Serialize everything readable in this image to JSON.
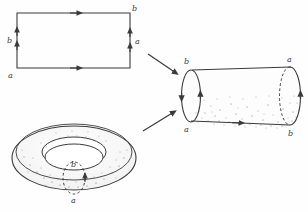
{
  "figure": {
    "type": "mathematical-diagram",
    "background_color": "#fefefe",
    "ink_color": "#3a3a3a",
    "stipple_color": "#6b6b6b"
  },
  "panels": {
    "rectangle": {
      "name": "identification-rectangle",
      "edges": {
        "top": {
          "label": "",
          "arrows": 1,
          "direction": "right"
        },
        "bottom": {
          "label": "",
          "arrows": 1,
          "direction": "right"
        },
        "left": {
          "label": "b",
          "arrows": 2,
          "direction": "up"
        },
        "right": {
          "label": "a",
          "arrows": 2,
          "direction": "up"
        }
      },
      "corners": {
        "bottom_left": "a",
        "top_right": "b"
      }
    },
    "cylinder": {
      "name": "intermediate-cylinder",
      "labels": {
        "left_top": "b",
        "left_bottom": "a",
        "right_top": "a",
        "right_bottom": "b"
      },
      "edges": {
        "top": {
          "arrows": 0
        },
        "bottom": {
          "arrows": 1,
          "direction": "right"
        },
        "left_circle": {
          "arrows": 2
        },
        "right_circle": {
          "arrows": 1,
          "style": "dashed-back-edge"
        }
      }
    },
    "torus": {
      "name": "resulting-torus",
      "labels": {
        "inner": "b",
        "bottom": "a"
      },
      "meridian": {
        "style": "dashed",
        "arrows": 1
      }
    }
  },
  "arrows": [
    {
      "name": "arrow-rectangle-to-cylinder",
      "direction": "down-right"
    },
    {
      "name": "arrow-torus-to-cylinder",
      "direction": "up-right"
    }
  ]
}
